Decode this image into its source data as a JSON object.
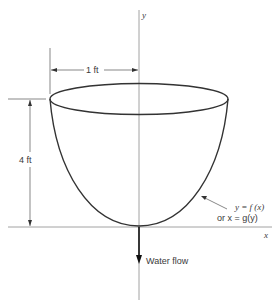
{
  "diagram": {
    "axes": {
      "x_label": "x",
      "y_label": "y"
    },
    "dimensions": {
      "radius_label": "1 ft",
      "height_label": "4 ft"
    },
    "curve_label": {
      "line1": "y = f (x)",
      "line2": "or x = g(y)"
    },
    "flow_label": "Water flow",
    "colors": {
      "line": "#333333",
      "axis": "#888888",
      "background": "#ffffff"
    }
  }
}
